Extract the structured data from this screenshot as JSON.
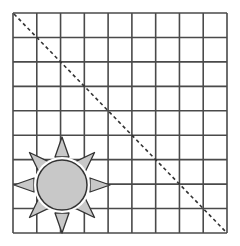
{
  "diagram": {
    "grid": {
      "columns": 9,
      "rows": 9,
      "x0": 13,
      "y0": 13,
      "x1": 227,
      "y1": 233,
      "line_color": "#4a4a4a",
      "line_width": 1.6
    },
    "diagonal": {
      "from": "top-left",
      "to": "bottom-right",
      "style": "dashed",
      "color": "#333333"
    },
    "sun": {
      "cx": 62,
      "cy": 185,
      "r": 25,
      "fill": "#c8c8c8",
      "stroke": "#333333",
      "rays": 8,
      "ray_fill": "#c8c8c8"
    }
  }
}
